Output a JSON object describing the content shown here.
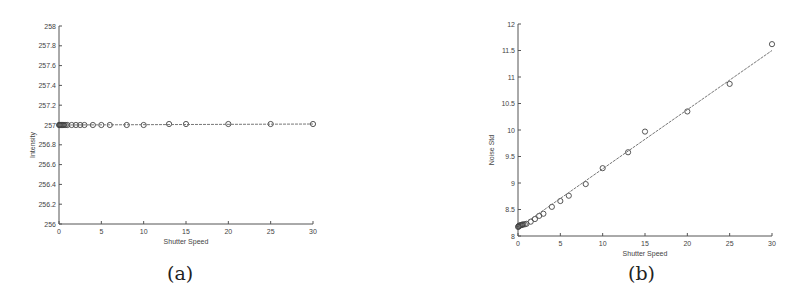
{
  "chart_data": [
    {
      "id": "a",
      "type": "line",
      "caption": "(a)",
      "title": "",
      "xlabel": "Shutter Speed",
      "ylabel": "Intensity",
      "xlim": [
        0,
        30
      ],
      "ylim": [
        256,
        258
      ],
      "xticks": [
        0,
        5,
        10,
        15,
        20,
        25,
        30
      ],
      "yticks": [
        256,
        256.2,
        256.4,
        256.6,
        256.8,
        257,
        257.2,
        257.4,
        257.6,
        257.8,
        258
      ],
      "ytick_labels": [
        "256",
        "256.2",
        "256.4",
        "256.6",
        "256.8",
        "257",
        "257.2",
        "257.4",
        "257.6",
        "257.8",
        "258"
      ],
      "grid": false,
      "legend": null,
      "series": [
        {
          "name": "measured",
          "marker": "circle",
          "x": [
            0.02,
            0.05,
            0.1,
            0.2,
            0.3,
            0.4,
            0.5,
            0.6,
            0.8,
            1,
            1.5,
            2,
            2.5,
            3,
            4,
            5,
            6,
            8,
            10,
            13,
            15,
            20,
            25,
            30
          ],
          "y": [
            257,
            257,
            257,
            257,
            257,
            257,
            257,
            257,
            257,
            257,
            257,
            257,
            257,
            257,
            257,
            257,
            257,
            257,
            257,
            257.01,
            257.01,
            257.01,
            257.01,
            257.01
          ]
        },
        {
          "name": "fit",
          "style": "line",
          "x": [
            0,
            30
          ],
          "y": [
            257,
            257.01
          ]
        }
      ]
    },
    {
      "id": "b",
      "type": "scatter",
      "caption": "(b)",
      "title": "",
      "xlabel": "Shutter Speed",
      "ylabel": "Noise Std",
      "xlim": [
        0,
        30
      ],
      "ylim": [
        8,
        12
      ],
      "xticks": [
        0,
        5,
        10,
        15,
        20,
        25,
        30
      ],
      "yticks": [
        8,
        8.5,
        9,
        9.5,
        10,
        10.5,
        11,
        11.5,
        12
      ],
      "ytick_labels": [
        "8",
        "8.5",
        "9",
        "9.5",
        "10",
        "10.5",
        "11",
        "11.5",
        "12"
      ],
      "grid": false,
      "legend": null,
      "series": [
        {
          "name": "measured",
          "marker": "circle",
          "x": [
            0.02,
            0.05,
            0.1,
            0.2,
            0.3,
            0.4,
            0.5,
            0.6,
            0.8,
            1,
            1.5,
            2,
            2.5,
            3,
            4,
            5,
            6,
            8,
            10,
            13,
            15,
            20,
            25,
            30
          ],
          "y": [
            8.17,
            8.18,
            8.19,
            8.2,
            8.2,
            8.21,
            8.21,
            8.22,
            8.22,
            8.23,
            8.27,
            8.32,
            8.38,
            8.42,
            8.55,
            8.66,
            8.76,
            8.98,
            9.28,
            9.58,
            9.97,
            10.35,
            10.87,
            11.62
          ]
        },
        {
          "name": "fit",
          "style": "line",
          "x": [
            0,
            30
          ],
          "y": [
            8.15,
            11.5
          ]
        }
      ]
    }
  ]
}
